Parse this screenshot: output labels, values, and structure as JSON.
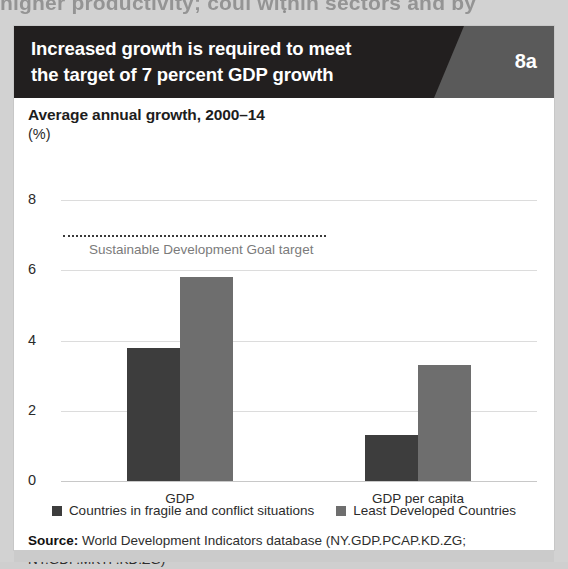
{
  "page": {
    "bleed_text_above": "higher productivity; coul within sectors and by",
    "background_color": "#d2d2d2"
  },
  "figure": {
    "banner": {
      "title_lines": [
        "Increased growth is required to meet",
        "the target of 7 percent GDP growth"
      ],
      "badge": "8a",
      "background_color": "#221f1f",
      "wedge_color": "#5a5a5a"
    },
    "subtitle": "Average annual growth, 2000–14",
    "subtitle_unit": "(%)",
    "legend": [
      {
        "label": "Countries in fragile and conflict situations",
        "color": "#3d3d3d"
      },
      {
        "label": "Least Developed Countries",
        "color": "#6e6e6e"
      }
    ],
    "source": {
      "label": "Source:",
      "text": " World Development Indicators database (NY.GDP.PCAP.KD.ZG; NY.GDP.MKTP.KD.ZG)"
    }
  },
  "chart_data": {
    "type": "bar",
    "title": "Increased growth is required to meet the target of 7 percent GDP growth",
    "subtitle": "Average annual growth, 2000–14",
    "xlabel": "",
    "ylabel": "(%)",
    "ylim": [
      0,
      8
    ],
    "yticks": [
      0,
      2,
      4,
      6,
      8
    ],
    "ytick_labels": [
      "0",
      "2",
      "4",
      "6",
      "8"
    ],
    "grid": true,
    "legend_position": "bottom",
    "categories": [
      "GDP",
      "GDP per capita"
    ],
    "series": [
      {
        "name": "Countries in fragile and conflict situations",
        "color": "#3d3d3d",
        "values": [
          3.8,
          1.3
        ]
      },
      {
        "name": "Least Developed Countries",
        "color": "#6e6e6e",
        "values": [
          5.8,
          3.3
        ]
      }
    ],
    "annotations": [
      {
        "type": "threshold-line",
        "label": "Sustainable Development Goal target",
        "value": 7.0,
        "style": "dotted",
        "color": "#3a3a3a"
      }
    ]
  }
}
